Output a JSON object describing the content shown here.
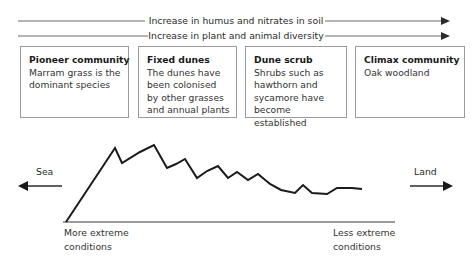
{
  "diagram": {
    "top_arrows": [
      {
        "label": "Increase in humus and nitrates in soil",
        "direction": "right"
      },
      {
        "label": "Increase in plant and animal diversity",
        "direction": "right"
      }
    ],
    "stages": [
      {
        "title": "Pioneer community",
        "body": "Marram grass is the dominant species"
      },
      {
        "title": "Fixed dunes",
        "body": "The dunes have been colonised by other grasses and annual plants"
      },
      {
        "title": "Dune scrub",
        "body": "Shrubs such as hawthorn and sycamore have become established"
      },
      {
        "title": "Climax community",
        "body": "Oak woodland"
      }
    ],
    "direction_labels": {
      "left": "Sea",
      "right": "Land"
    },
    "condition_labels": {
      "left_line1": "More extreme",
      "left_line2": "conditions",
      "right_line1": "Less extreme",
      "right_line2": "conditions"
    },
    "colors": {
      "line": "#1a1a1a",
      "box_border": "#9a9a9a",
      "arrow": "#555555",
      "text": "#333333",
      "background": "#ffffff"
    }
  },
  "chart_data": {
    "type": "line",
    "xlabel": "Distance inland (sea on left, land on right)",
    "ylabel": "Dune height",
    "grid": false,
    "legend": "none",
    "baseline_y": 222,
    "profile_points": [
      [
        66,
        222
      ],
      [
        115,
        148
      ],
      [
        122,
        163
      ],
      [
        140,
        152
      ],
      [
        154,
        145
      ],
      [
        167,
        168
      ],
      [
        176,
        164
      ],
      [
        185,
        159
      ],
      [
        197,
        178
      ],
      [
        207,
        171
      ],
      [
        218,
        166
      ],
      [
        228,
        178
      ],
      [
        237,
        172
      ],
      [
        248,
        180
      ],
      [
        258,
        174
      ],
      [
        270,
        184
      ],
      [
        281,
        190
      ],
      [
        295,
        193
      ],
      [
        303,
        185
      ],
      [
        312,
        193
      ],
      [
        327,
        194
      ],
      [
        337,
        188
      ],
      [
        352,
        188
      ],
      [
        362,
        189
      ]
    ],
    "annotations": [
      {
        "text": "More extreme conditions",
        "at_x": 66
      },
      {
        "text": "Less extreme conditions",
        "at_x": 335
      }
    ]
  }
}
